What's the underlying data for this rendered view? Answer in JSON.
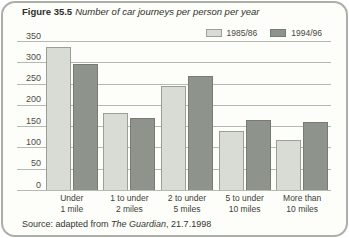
{
  "figure": {
    "label": "Figure 35.5",
    "title": "Number of car journeys per person per year"
  },
  "legend": [
    {
      "name": "1985/86",
      "color": "#d9dcd4",
      "border": "#9ba097"
    },
    {
      "name": "1994/96",
      "color": "#8e938c",
      "border": "#767b74"
    }
  ],
  "source": {
    "prefix": "Source: adapted from ",
    "publication": "The Guardian",
    "suffix": ", 21.7.1998"
  },
  "colors": {
    "card_border": "#abafa8",
    "card_background": "#fdfdfa",
    "gridline": "#b5bab2",
    "text": "#2e312b",
    "axis_text": "#4b4e47"
  },
  "chart_data": {
    "type": "bar",
    "title": "Number of car journeys per person per year",
    "categories": [
      [
        "Under",
        "1 mile"
      ],
      [
        "1 to under",
        "2 miles"
      ],
      [
        "2 to under",
        "5 miles"
      ],
      [
        "5 to under",
        "10 miles"
      ],
      [
        "More than",
        "10 miles"
      ]
    ],
    "series": [
      {
        "name": "1985/86",
        "color": "#d9dcd4",
        "border": "#9ba097",
        "values": [
          335,
          180,
          245,
          138,
          118
        ]
      },
      {
        "name": "1994/96",
        "color": "#8e938c",
        "border": "#767b74",
        "values": [
          295,
          170,
          268,
          165,
          160
        ]
      }
    ],
    "xlabel": "",
    "ylabel": "",
    "ylim": [
      0,
      350
    ],
    "ytick_step": 50,
    "yticks": [
      350,
      300,
      250,
      200,
      150,
      100,
      50,
      0
    ],
    "grid": true,
    "legend_position": "top-right"
  }
}
